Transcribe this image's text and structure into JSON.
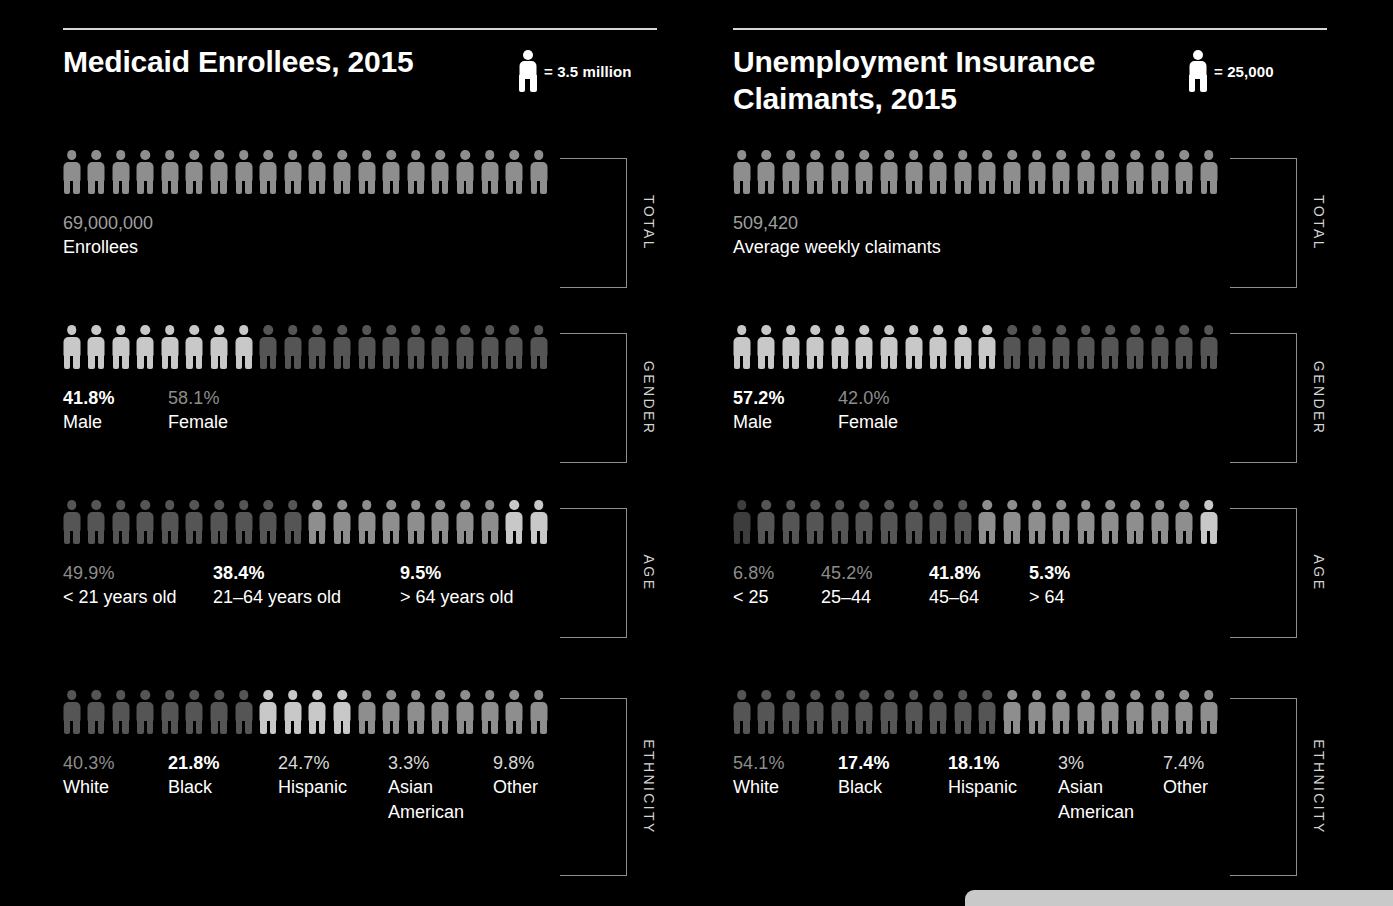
{
  "chart_data": {
    "type": "pictogram",
    "panels": [
      {
        "id": "medicaid",
        "title": "Medicaid Enrollees, 2015",
        "legend_unit": "= 3.5 million",
        "legend_icon": "person-icon",
        "rows": [
          {
            "category": "TOTAL",
            "icon_count": 20,
            "segments": [
              {
                "count": 20,
                "shade": "mid"
              }
            ],
            "labels": [
              {
                "value": "69,000,000",
                "name": "Enrollees",
                "style": "value",
                "x": 0
              }
            ]
          },
          {
            "category": "GENDER",
            "icon_count": 20,
            "segments": [
              {
                "count": 8,
                "shade": "light"
              },
              {
                "count": 12,
                "shade": "dark"
              }
            ],
            "labels": [
              {
                "value": "41.8%",
                "name": "Male",
                "style": "bright",
                "x": 0
              },
              {
                "value": "58.1%",
                "name": "Female",
                "style": "dim",
                "x": 105
              }
            ]
          },
          {
            "category": "AGE",
            "icon_count": 20,
            "segments": [
              {
                "count": 10,
                "shade": "dark"
              },
              {
                "count": 8,
                "shade": "mid"
              },
              {
                "count": 2,
                "shade": "light"
              }
            ],
            "labels": [
              {
                "value": "49.9%",
                "name": "< 21 years old",
                "style": "dim",
                "x": 0
              },
              {
                "value": "38.4%",
                "name": "21–64 years old",
                "style": "bright",
                "x": 150
              },
              {
                "value": "9.5%",
                "name": "> 64 years old",
                "style": "bright",
                "x": 337
              }
            ]
          },
          {
            "category": "ETHNICITY",
            "icon_count": 20,
            "segments": [
              {
                "count": 8,
                "shade": "dark"
              },
              {
                "count": 4,
                "shade": "light"
              },
              {
                "count": 8,
                "shade": "mid"
              }
            ],
            "labels": [
              {
                "value": "40.3%",
                "name": "White",
                "style": "dim",
                "x": 0
              },
              {
                "value": "21.8%",
                "name": "Black",
                "style": "bright",
                "x": 105
              },
              {
                "value": "24.7%",
                "name": "Hispanic",
                "style": "mid",
                "x": 215
              },
              {
                "value": "3.3%",
                "name": "Asian\nAmerican",
                "style": "mid",
                "x": 325
              },
              {
                "value": "9.8%",
                "name": "Other",
                "style": "mid",
                "x": 430
              }
            ]
          }
        ]
      },
      {
        "id": "unemployment",
        "title": "Unemployment Insurance Claimants, 2015",
        "legend_unit": "= 25,000",
        "legend_icon": "person-icon",
        "rows": [
          {
            "category": "TOTAL",
            "icon_count": 20,
            "segments": [
              {
                "count": 20,
                "shade": "mid"
              }
            ],
            "labels": [
              {
                "value": "509,420",
                "name": "Average weekly claimants",
                "style": "value",
                "x": 0
              }
            ]
          },
          {
            "category": "GENDER",
            "icon_count": 20,
            "segments": [
              {
                "count": 11,
                "shade": "light"
              },
              {
                "count": 9,
                "shade": "dark"
              }
            ],
            "labels": [
              {
                "value": "57.2%",
                "name": "Male",
                "style": "bright",
                "x": 0
              },
              {
                "value": "42.0%",
                "name": "Female",
                "style": "dim",
                "x": 105
              }
            ]
          },
          {
            "category": "AGE",
            "icon_count": 20,
            "segments": [
              {
                "count": 1,
                "shade": "darker"
              },
              {
                "count": 9,
                "shade": "dark"
              },
              {
                "count": 9,
                "shade": "mid"
              },
              {
                "count": 1,
                "shade": "light"
              }
            ],
            "labels": [
              {
                "value": "6.8%",
                "name": "< 25",
                "style": "dim",
                "x": 0
              },
              {
                "value": "45.2%",
                "name": "25–44",
                "style": "dim",
                "x": 88
              },
              {
                "value": "41.8%",
                "name": "45–64",
                "style": "bright",
                "x": 196
              },
              {
                "value": "5.3%",
                "name": "> 64",
                "style": "bright",
                "x": 296
              }
            ]
          },
          {
            "category": "ETHNICITY",
            "icon_count": 20,
            "segments": [
              {
                "count": 11,
                "shade": "dark"
              },
              {
                "count": 9,
                "shade": "mid"
              }
            ],
            "labels": [
              {
                "value": "54.1%",
                "name": "White",
                "style": "dim",
                "x": 0
              },
              {
                "value": "17.4%",
                "name": "Black",
                "style": "bright",
                "x": 105
              },
              {
                "value": "18.1%",
                "name": "Hispanic",
                "style": "bright",
                "x": 215
              },
              {
                "value": "3%",
                "name": "Asian\nAmerican",
                "style": "mid",
                "x": 325
              },
              {
                "value": "7.4%",
                "name": "Other",
                "style": "mid",
                "x": 430
              }
            ]
          }
        ]
      }
    ],
    "shades": {
      "light": "#c8c8c8",
      "mid": "#8e8e8e",
      "dark": "#555555",
      "darker": "#3d3d3d"
    },
    "row_tops": [
      150,
      325,
      500,
      690
    ],
    "bracket_color": "#8f8f8f",
    "background": "#000000",
    "bottom_bar_color": "#c9c9c9"
  }
}
